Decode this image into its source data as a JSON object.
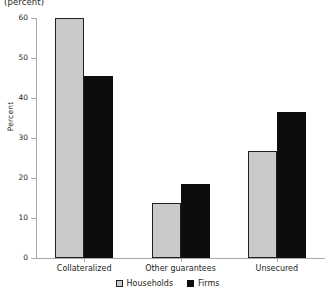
{
  "caption": {
    "unit_note": "(percent)"
  },
  "chart_data": {
    "type": "bar",
    "title": "",
    "subtitle": "",
    "xlabel": "",
    "ylabel": "Percent",
    "unit_note": "(percent)",
    "categories": [
      "Collateralized",
      "Other guarantees",
      "Unsecured"
    ],
    "series": [
      {
        "name": "Households",
        "color": "#c9cacb",
        "values": [
          60.0,
          13.75,
          26.75
        ]
      },
      {
        "name": "Firms",
        "color": "#0d0d0d",
        "values": [
          45.6,
          18.5,
          36.5
        ]
      }
    ],
    "ylim": [
      0,
      60
    ],
    "yticks": [
      0,
      10,
      20,
      30,
      40,
      50,
      60
    ],
    "ytick_labels": [
      "0",
      "10",
      "20",
      "30",
      "40",
      "50",
      "60"
    ],
    "grid": false,
    "legend_position": "bottom-center",
    "legend_entries": [
      "Households",
      "Firms"
    ]
  }
}
